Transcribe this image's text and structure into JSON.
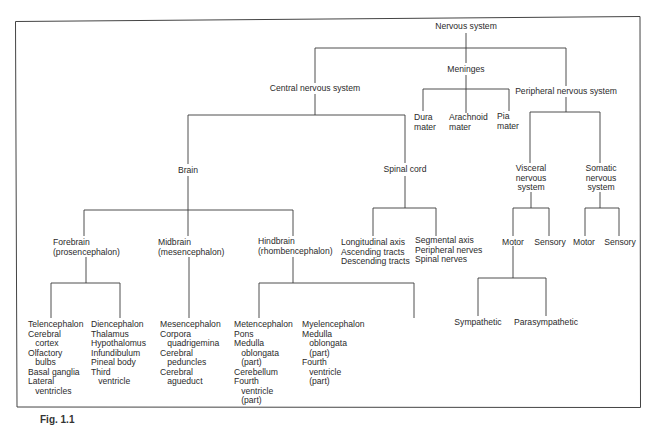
{
  "diagram": {
    "root": "Nervous system",
    "level1": {
      "cns": "Central nervous system",
      "meninges": "Meninges",
      "pns": "Peripheral nervous system"
    },
    "meninges_children": {
      "dura": "Dura\nmater",
      "arachnoid": "Arachnoid\nmater",
      "pia": "Pia\nmater"
    },
    "cns_children": {
      "brain": "Brain",
      "spinal_cord": "Spinal cord"
    },
    "brain_children": {
      "forebrain": "Forebrain\n(prosencephalon)",
      "midbrain": "Midbrain\n(mesencephalon)",
      "hindbrain": "Hindbrain\n(rhombencephalon)"
    },
    "forebrain_children": {
      "telencephalon": "Telencephalon\nCerebral\n   cortex\nOlfactory\n   bulbs\nBasal ganglia\nLateral\n   ventricles",
      "diencephalon": "Diencephalon\nThalamus\nHypothalomus\nInfundibulum\nPineal body\nThird\n   ventricle"
    },
    "midbrain_children": {
      "mesencephalon": "Mesencephalon\nCorpora\n   quadrigemina\nCerebral\n   peduncles\nCerebral\n   agueduct"
    },
    "hindbrain_children": {
      "metencephalon": "Metencephalon\nPons\nMedulla\n   oblongata\n   (part)\nCerebellum\nFourth\n   ventricle\n   (part)",
      "myelencephalon": "Myelencephalon\nMedulla\n   oblongata\n   (part)\nFourth\n   ventricle\n   (part)"
    },
    "spinal_cord_children": {
      "longitudinal": "Longitudinal axis\nAscending tracts\nDescending tracts",
      "segmental": "Segmental axis\nPeripheral nerves\nSpinal nerves"
    },
    "pns_children": {
      "visceral": "Visceral\nnervous\nsystem",
      "somatic": "Somatic\nnervous\nsystem"
    },
    "visceral_children": {
      "motor": "Motor",
      "sensory": "Sensory"
    },
    "somatic_children": {
      "motor": "Motor",
      "sensory": "Sensory"
    },
    "visceral_motor_children": {
      "sympathetic": "Sympathetic",
      "parasympathetic": "Parasympathetic"
    }
  },
  "caption": "Fig. 1.1"
}
